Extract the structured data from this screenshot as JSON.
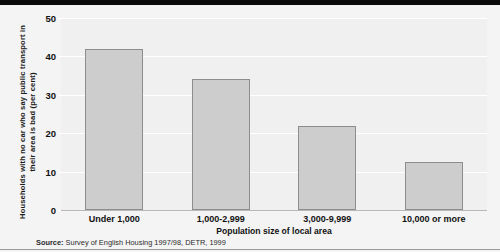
{
  "chart_data": {
    "type": "bar",
    "title": "",
    "xlabel": "Population size of local area",
    "ylabel": "Households with no car who say public transport in their area is bad (per cent)",
    "categories": [
      "Under 1,000",
      "1,000-2,999",
      "3,000-9,999",
      "10,000 or more"
    ],
    "values": [
      42,
      34,
      22,
      12.5
    ],
    "ylim": [
      0,
      50
    ],
    "yticks": [
      0,
      10,
      20,
      30,
      40,
      50
    ],
    "ytick_labels": [
      "0",
      "10",
      "20",
      "30",
      "40",
      "50"
    ],
    "grid": true,
    "legend": "none",
    "series": [
      {
        "name": "Households with no car who say public transport is bad",
        "values": [
          42,
          34,
          22,
          12.5
        ]
      }
    ],
    "bar_color": "#cdcdcd",
    "bar_edge_color": "#8d8d8d",
    "plot_background": "#f0f0f0",
    "gridline_color": "#ffffff"
  },
  "footer": {
    "source_label": "Source:",
    "source_text": "Survey of English Housing 1997/98, DETR, 1999"
  }
}
